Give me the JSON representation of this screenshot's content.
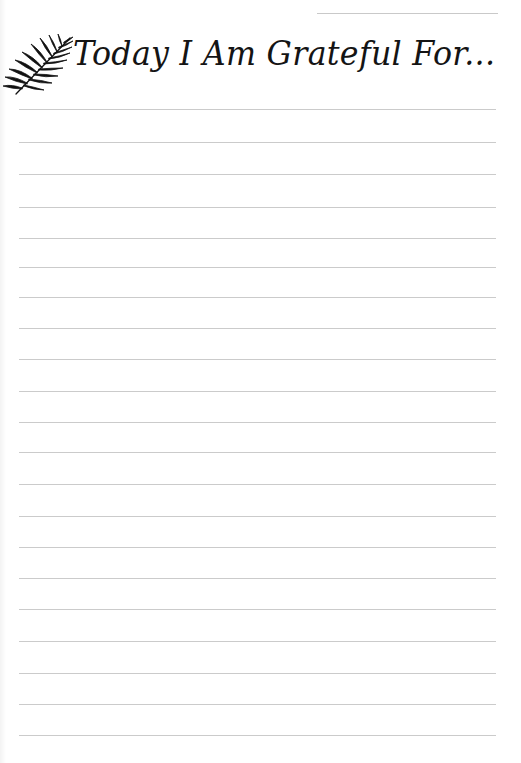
{
  "page": {
    "title": "Today I Am Grateful For...",
    "title_color": "#141414",
    "rule_color": "#cbcbcb",
    "background": "#ffffff"
  },
  "header": {
    "icon": "palm-leaf-icon",
    "date_line": {
      "label": ""
    }
  },
  "writing_lines": {
    "count": 21,
    "y_positions": [
      109,
      142,
      174,
      207,
      238,
      267,
      297,
      328,
      359,
      391,
      422,
      452,
      484,
      516,
      547,
      578,
      609,
      641,
      673,
      704,
      735
    ]
  }
}
